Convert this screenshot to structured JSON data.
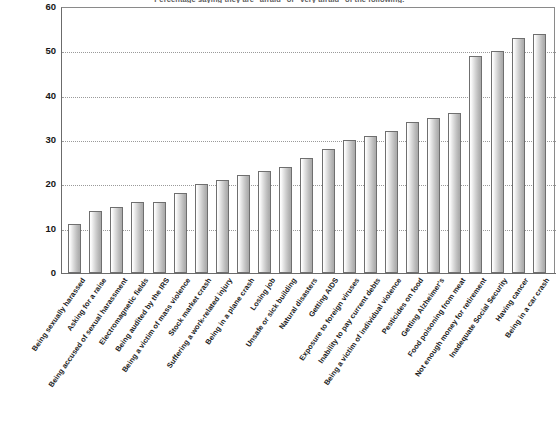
{
  "chart_data": {
    "type": "bar",
    "title": "Percentage saying they are \"afraid\" or \"very afraid\" of the following:",
    "xlabel": "",
    "ylabel": "",
    "ylim": [
      0,
      60
    ],
    "yticks": [
      0,
      10,
      20,
      30,
      40,
      50,
      60
    ],
    "grid": true,
    "legend": "none",
    "categories": [
      "Being sexually harassed",
      "Asking for a raise",
      "Being accused of sexual harassment",
      "Electromagnetic fields",
      "Being audited by the IRS",
      "Being a victim of mass violence",
      "Stock market crash",
      "Suffering a work-related injury",
      "Being in a plane crash",
      "Losing job",
      "Unsafe or sick building",
      "Natural disasters",
      "Getting AIDS",
      "Exposure to foreign viruses",
      "Inability to pay current debts",
      "Being a victim of individual violence",
      "Pesticides on food",
      "Getting Alzheimer's",
      "Food poisoning from meat",
      "Not enough money for retirement",
      "Inadequate Social Security",
      "Having cancer",
      "Being in a car crash"
    ],
    "values": [
      11,
      14,
      15,
      16,
      16,
      18,
      20,
      21,
      22,
      23,
      24,
      26,
      28,
      30,
      31,
      32,
      34,
      35,
      36,
      49,
      50,
      53,
      54
    ]
  },
  "colors": {
    "bar_fill_light": "#ffffff",
    "bar_fill_dark": "#a9a9a9",
    "bar_border": "#6f6f6f",
    "axis": "#6b6b6b",
    "gridline": "#9a9a9a",
    "text": "#161616",
    "background": "#ffffff"
  }
}
